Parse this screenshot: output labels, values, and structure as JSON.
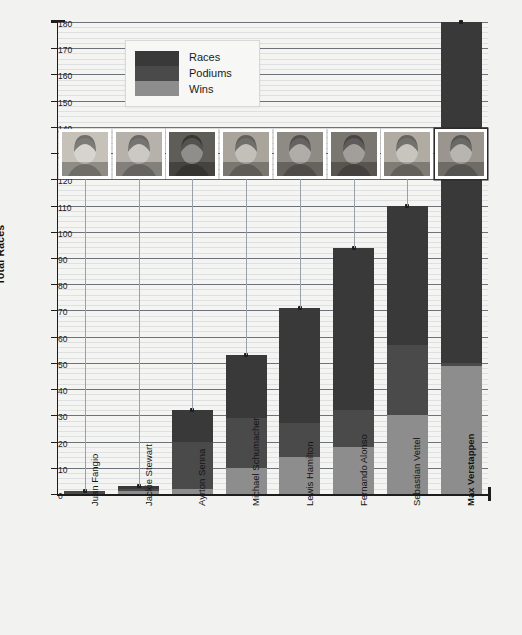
{
  "chart_data": {
    "type": "bar",
    "stacked": true,
    "title": "",
    "xlabel": "",
    "ylabel": "Total Races",
    "ylim": [
      0,
      180
    ],
    "ytick_step": 10,
    "yticks": [
      0,
      10,
      20,
      30,
      40,
      50,
      60,
      70,
      80,
      90,
      100,
      110,
      120,
      130,
      140,
      150,
      160,
      170,
      180
    ],
    "grid": true,
    "legend_position": "top-left-inside",
    "categories": [
      "Juan Fangio",
      "Jackie Stewart",
      "Ayrton Senna",
      "Michael Schumacher",
      "Lewis Hamilton",
      "Fernando Alonso",
      "Sebastian Vettel",
      "Max Verstappen"
    ],
    "highlight_category": "Max Verstappen",
    "series": [
      {
        "name": "Races",
        "values": [
          1,
          3,
          32,
          53,
          71,
          94,
          110,
          180
        ]
      },
      {
        "name": "Podiums",
        "values": [
          1,
          2,
          20,
          29,
          27,
          32,
          57,
          50
        ]
      },
      {
        "name": "Wins",
        "values": [
          0,
          1,
          2,
          10,
          14,
          18,
          30,
          49
        ]
      }
    ],
    "markers": {
      "label": "photo-connector-marker",
      "y_value": 122
    }
  },
  "legend": {
    "entries": [
      {
        "label": "Races",
        "color": "#393939"
      },
      {
        "label": "Podiums",
        "color": "#4a4a4a"
      },
      {
        "label": "Wins",
        "color": "#8d8d8d"
      }
    ]
  },
  "axis": {
    "y_title": "Total Races"
  },
  "colors": {
    "races": "#393939",
    "podiums": "#4a4a4a",
    "wins": "#8d8d8d",
    "background": "#f2f2f0",
    "axis": "#1d1d1d",
    "grid_major": "#5a6070",
    "grid_minor": "#b6bcc6"
  },
  "photos": [
    {
      "driver": "Juan Fangio",
      "tone": "#c6c2ba",
      "highlight": false
    },
    {
      "driver": "Jackie Stewart",
      "tone": "#b6b2ab",
      "highlight": false
    },
    {
      "driver": "Ayrton Senna",
      "tone": "#5f5d58",
      "highlight": false
    },
    {
      "driver": "Michael Schumacher",
      "tone": "#a9a59d",
      "highlight": false
    },
    {
      "driver": "Lewis Hamilton",
      "tone": "#8e8a84",
      "highlight": false
    },
    {
      "driver": "Fernando Alonso",
      "tone": "#7a7670",
      "highlight": false
    },
    {
      "driver": "Sebastian Vettel",
      "tone": "#b0aca4",
      "highlight": false
    },
    {
      "driver": "Max Verstappen",
      "tone": "#9a968f",
      "highlight": true
    }
  ]
}
